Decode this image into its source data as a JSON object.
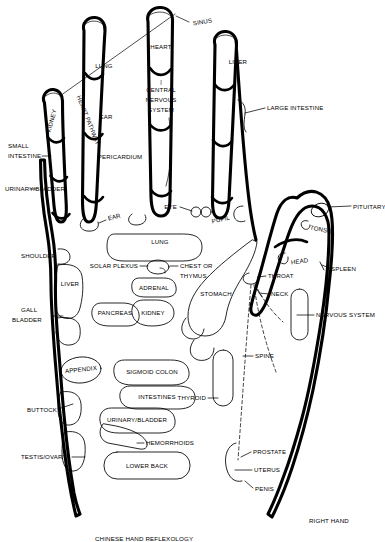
{
  "figure": {
    "title": "CHINESE HAND REFLEXOLOGY",
    "hand_side": "RIGHT HAND",
    "type": "reflexology-chart",
    "colors": {
      "background": "#ffffff",
      "ink": "#000000"
    }
  },
  "fingers": {
    "pinky": {
      "name": "pinky",
      "labels": [
        "KIDNEY"
      ]
    },
    "ring": {
      "name": "ring",
      "labels": [
        "LUNG",
        "EAR",
        "PERICARDIUM"
      ]
    },
    "middle": {
      "name": "middle",
      "labels": [
        "HEART",
        "CENTRAL",
        "NERVOUS",
        "SYSTEM"
      ]
    },
    "index": {
      "name": "index",
      "labels": [
        "LIVER"
      ]
    },
    "thumb": {
      "name": "thumb",
      "labels": [
        "PITUITARY",
        "TONSIL",
        "HEAD"
      ]
    }
  },
  "labels": {
    "sinus": "SINUS",
    "heart": "HEART",
    "cns_line1": "CENTRAL",
    "cns_line2": "NERVOUS",
    "cns_line3": "SYSTEM",
    "lung_finger": "LUNG",
    "ear_finger": "EAR",
    "pericardium": "PERICARDIUM",
    "liver_finger": "LIVER",
    "large_intestine": "LARGE INTESTINE",
    "kidney_finger": "KIDNEY",
    "heart_pathway": "HEART PATHWAY",
    "small_intestine_l1": "SMALL",
    "small_intestine_l2": "INTESTINE",
    "urinary_bladder_left": "URINARY/BLADDER",
    "ear_base": "EAR",
    "eye": "EYE",
    "pupil": "PUPIL",
    "pituitary": "PITUITARY",
    "tonsil": "TONSIL",
    "head": "HEAD",
    "spleen": "SPLEEN",
    "throat": "THROAT",
    "neck": "NECK",
    "nervous_system": "NERVOUS SYSTEM",
    "spine": "SPINE",
    "shoulder": "SHOULDER",
    "solar_plexus": "SOLAR PLEXUS",
    "lung_palm": "LUNG",
    "chest_or_l1": "CHEST OR",
    "chest_or_l2": "THYMUS",
    "adrenal": "ADRENAL",
    "pancreas": "PANCREAS",
    "kidney_palm": "KIDNEY",
    "stomach": "STOMACH",
    "liver_palm": "LIVER",
    "gall_l1": "GALL",
    "gall_l2": "BLADDER",
    "appendix": "APPENDIX",
    "sigmoid_colon": "SIGMOID COLON",
    "intestines": "INTESTINES",
    "thyroid": "THYROID",
    "buttock": "BUTTOCK",
    "urinary_bladder_palm": "URINARY/BLADDER",
    "hemorrhoids": "HEMORRHOIDS",
    "lower_back": "LOWER BACK",
    "testis_ovary": "TESTIS/OVARY",
    "prostate": "PROSTATE",
    "uterus": "UTERUS",
    "penis": "PENIS",
    "right_hand": "RIGHT HAND",
    "caption": "CHINESE HAND REFLEXOLOGY"
  },
  "zone_list": [
    "SINUS",
    "HEART",
    "CENTRAL NERVOUS SYSTEM",
    "LUNG",
    "EAR",
    "PERICARDIUM",
    "LIVER",
    "LARGE INTESTINE",
    "KIDNEY",
    "HEART PATHWAY",
    "SMALL INTESTINE",
    "URINARY/BLADDER",
    "EYE",
    "PUPIL",
    "PITUITARY",
    "TONSIL",
    "HEAD",
    "SPLEEN",
    "THROAT",
    "NECK",
    "NERVOUS SYSTEM",
    "SPINE",
    "SHOULDER",
    "SOLAR PLEXUS",
    "CHEST OR THYMUS",
    "ADRENAL",
    "PANCREAS",
    "STOMACH",
    "GALL BLADDER",
    "APPENDIX",
    "SIGMOID COLON",
    "INTESTINES",
    "THYROID",
    "BUTTOCK",
    "HEMORRHOIDS",
    "LOWER BACK",
    "TESTIS/OVARY",
    "PROSTATE",
    "UTERUS",
    "PENIS"
  ]
}
